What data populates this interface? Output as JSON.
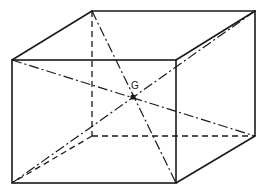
{
  "diagram": {
    "center_label": "G",
    "vertices": {
      "front_top_left": [
        12,
        60
      ],
      "front_top_right": [
        176,
        60
      ],
      "front_bottom_left": [
        12,
        183
      ],
      "front_bottom_right": [
        176,
        183
      ],
      "back_top_left": [
        92,
        11
      ],
      "back_top_right": [
        255,
        11
      ],
      "back_bottom_left": [
        92,
        136
      ],
      "back_bottom_right": [
        255,
        136
      ]
    },
    "center": [
      133,
      97
    ],
    "edges": {
      "visible": [
        "front face",
        "top face",
        "right face"
      ],
      "hidden": [
        "back_top_left-back_bottom_left",
        "back_bottom_left-back_bottom_right",
        "back_bottom_left-front_bottom_left"
      ]
    },
    "diagonals": [
      "front_top_left-back_bottom_right",
      "back_top_left-front_bottom_right",
      "back_top_right-front_bottom_left",
      "front_top_right-back_bottom_left"
    ]
  }
}
